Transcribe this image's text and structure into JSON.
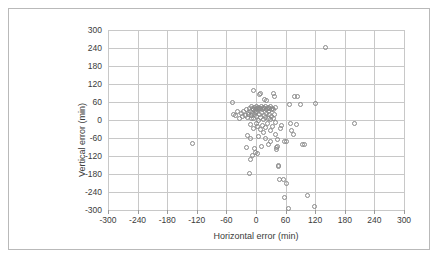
{
  "chart_data": {
    "type": "scatter",
    "title": "",
    "xlabel": "Horizontal error (min)",
    "ylabel": "Vertical error (min)",
    "xlim": [
      -300,
      300
    ],
    "ylim": [
      -300,
      300
    ],
    "xticks": [
      -300,
      -240,
      -180,
      -120,
      -60,
      0,
      60,
      120,
      180,
      240,
      300
    ],
    "yticks": [
      -300,
      -240,
      -180,
      -120,
      -60,
      0,
      60,
      120,
      180,
      240,
      300
    ],
    "xtick_labels": [
      "-300",
      "-240",
      "-180",
      "-120",
      "-60",
      "0",
      "60",
      "120",
      "180",
      "240",
      "300"
    ],
    "ytick_labels": [
      "-300",
      "-240",
      "-180",
      "-120",
      "-60",
      "0",
      "60",
      "120",
      "180",
      "240",
      "300"
    ],
    "grid": true,
    "legend": false,
    "marker": "open-circle",
    "marker_color": "#8a8a8a",
    "series": [
      {
        "name": "errors",
        "points": [
          [
            140,
            243
          ],
          [
            -128,
            -78
          ],
          [
            200,
            -12
          ],
          [
            120,
            55
          ],
          [
            118,
            -288
          ],
          [
            105,
            -252
          ],
          [
            95,
            -82
          ],
          [
            78,
            80
          ],
          [
            68,
            52
          ],
          [
            65,
            -295
          ],
          [
            62,
            -212
          ],
          [
            58,
            -258
          ],
          [
            55,
            -198
          ],
          [
            52,
            -18
          ],
          [
            50,
            -28
          ],
          [
            48,
            -198
          ],
          [
            46,
            -152
          ],
          [
            45,
            -155
          ],
          [
            44,
            -66
          ],
          [
            43,
            -88
          ],
          [
            42,
            -98
          ],
          [
            41,
            -92
          ],
          [
            40,
            42
          ],
          [
            40,
            -8
          ],
          [
            39,
            -48
          ],
          [
            38,
            18
          ],
          [
            37,
            80
          ],
          [
            36,
            88
          ],
          [
            35,
            36
          ],
          [
            35,
            6
          ],
          [
            34,
            -22
          ],
          [
            33,
            40
          ],
          [
            32,
            12
          ],
          [
            31,
            34
          ],
          [
            30,
            44
          ],
          [
            30,
            2
          ],
          [
            29,
            -36
          ],
          [
            28,
            38
          ],
          [
            27,
            18
          ],
          [
            26,
            42
          ],
          [
            25,
            30
          ],
          [
            25,
            4
          ],
          [
            24,
            -12
          ],
          [
            23,
            40
          ],
          [
            22,
            22
          ],
          [
            21,
            36
          ],
          [
            20,
            44
          ],
          [
            20,
            8
          ],
          [
            19,
            -26
          ],
          [
            18,
            40
          ],
          [
            17,
            16
          ],
          [
            16,
            38
          ],
          [
            15,
            42
          ],
          [
            15,
            2
          ],
          [
            14,
            -18
          ],
          [
            13,
            36
          ],
          [
            12,
            26
          ],
          [
            11,
            44
          ],
          [
            10,
            40
          ],
          [
            10,
            10
          ],
          [
            9,
            -32
          ],
          [
            8,
            38
          ],
          [
            7,
            20
          ],
          [
            6,
            42
          ],
          [
            5,
            34
          ],
          [
            5,
            0
          ],
          [
            4,
            -22
          ],
          [
            3,
            40
          ],
          [
            2,
            30
          ],
          [
            1,
            44
          ],
          [
            0,
            38
          ],
          [
            0,
            12
          ],
          [
            0,
            -10
          ],
          [
            -1,
            34
          ],
          [
            -2,
            24
          ],
          [
            -3,
            42
          ],
          [
            -4,
            18
          ],
          [
            -5,
            36
          ],
          [
            -5,
            4
          ],
          [
            -6,
            -28
          ],
          [
            -7,
            40
          ],
          [
            -8,
            22
          ],
          [
            -9,
            14
          ],
          [
            -10,
            44
          ],
          [
            -10,
            6
          ],
          [
            -11,
            -16
          ],
          [
            -12,
            30
          ],
          [
            -14,
            38
          ],
          [
            -15,
            18
          ],
          [
            -16,
            26
          ],
          [
            -18,
            8
          ],
          [
            -20,
            34
          ],
          [
            -22,
            16
          ],
          [
            -25,
            28
          ],
          [
            -28,
            12
          ],
          [
            -30,
            22
          ],
          [
            -34,
            6
          ],
          [
            -38,
            30
          ],
          [
            -42,
            14
          ],
          [
            -48,
            58
          ],
          [
            -46,
            18
          ],
          [
            -6,
            98
          ],
          [
            8,
            86
          ],
          [
            10,
            90
          ],
          [
            18,
            70
          ],
          [
            22,
            66
          ],
          [
            -18,
            -52
          ],
          [
            -12,
            -62
          ],
          [
            -8,
            -118
          ],
          [
            -4,
            -96
          ],
          [
            -2,
            -108
          ],
          [
            4,
            -112
          ],
          [
            12,
            -88
          ],
          [
            -12,
            -132
          ],
          [
            -14,
            -178
          ],
          [
            -20,
            -92
          ],
          [
            58,
            -72
          ],
          [
            62,
            -70
          ],
          [
            70,
            -12
          ],
          [
            82,
            -14
          ],
          [
            76,
            -48
          ],
          [
            72,
            -36
          ],
          [
            84,
            80
          ],
          [
            90,
            52
          ],
          [
            98,
            -82
          ],
          [
            30,
            -70
          ],
          [
            26,
            -82
          ],
          [
            20,
            -60
          ],
          [
            16,
            -42
          ],
          [
            5,
            -56
          ]
        ]
      }
    ]
  },
  "axis": {
    "x_title": "Horizontal error (min)",
    "y_title": "Vertical error (min)"
  }
}
